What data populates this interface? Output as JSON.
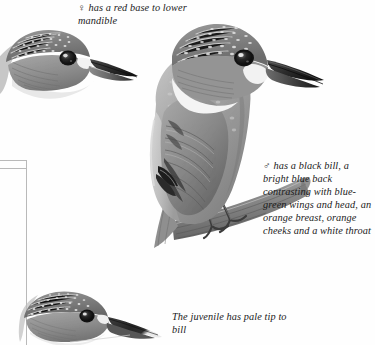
{
  "plate": {
    "subject": "Common Kingfisher plumage variations",
    "background_color": "#fefefe",
    "rule_color": "#b9b9b9"
  },
  "captions": {
    "female": "♀ has a red base to lower mandible",
    "male": "♂ has a black bill, a bright blue back contrasting with blue-green wings and head, an orange breast, orange cheeks and a white throat",
    "juvenile": "The juvenile has pale tip to bill"
  },
  "figures": [
    {
      "id": "female-head",
      "label": "female-kingfisher-head",
      "description": "Head and bill profile of female kingfisher facing right"
    },
    {
      "id": "male-perched",
      "label": "male-kingfisher-perched",
      "description": "Full body male kingfisher perched on a diagonal branch"
    },
    {
      "id": "juvenile-head",
      "label": "juvenile-kingfisher-head",
      "description": "Head and bill profile of juvenile kingfisher facing right"
    }
  ]
}
